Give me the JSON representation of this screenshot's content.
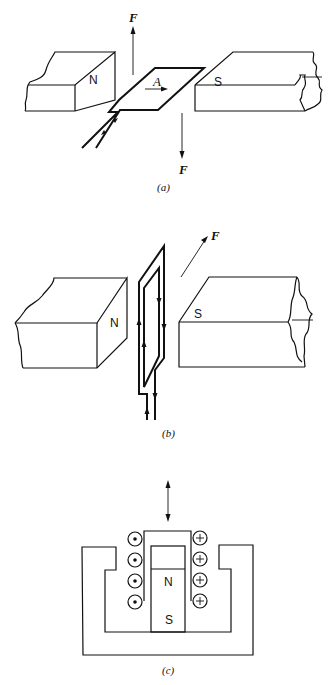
{
  "figure": {
    "panels": [
      {
        "id": "a",
        "caption": "(a)",
        "labels": {
          "north_pole": "N",
          "south_pole": "S",
          "force_up": "F",
          "force_down": "F",
          "current_direction": "A"
        },
        "description": "Flat conductor loop between N and S magnet poles; force F up on one side, F down on other"
      },
      {
        "id": "b",
        "caption": "(b)",
        "labels": {
          "north_pole": "N",
          "south_pole": "S",
          "force": "F"
        },
        "description": "Vertical rectangular coil between N and S magnet poles with current arrows; force F diagonal"
      },
      {
        "id": "c",
        "caption": "(c)",
        "labels": {
          "north_pole": "N",
          "south_pole": "S",
          "coil_left_symbol": "dot (current out of page)",
          "coil_right_symbol": "cross (current into page)"
        },
        "coil_turns_per_side": 4,
        "description": "Moving-coil (voice-coil) actuator cross-section: permanent magnet in pot core with coil; double-headed arrow shows motion"
      }
    ]
  }
}
